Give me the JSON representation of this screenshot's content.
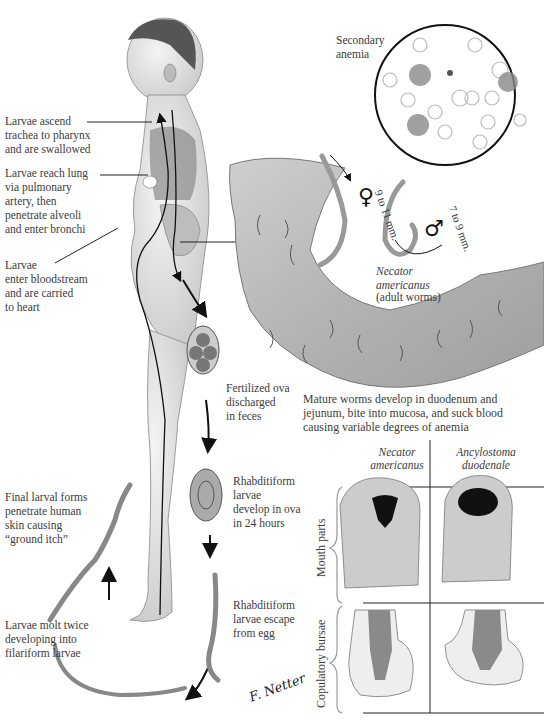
{
  "diagram": {
    "labels": {
      "larvae_ascend": "Larvae ascend\ntrachea to pharynx\nand are swallowed",
      "larvae_reach_lung": "Larvae reach lung\nvia pulmonary\nartery, then\npenetrate alveoli\nand enter bronchi",
      "larvae_enter_bloodstream": "Larvae\nenter bloodstream\nand are carried\nto heart",
      "secondary_anemia": "Secondary\nanemia",
      "female_size": "9 to 11 mm.",
      "male_size": "7 to 9 mm.",
      "female_symbol": "♀",
      "male_symbol": "♂",
      "species_adult": "Necator\namericanus",
      "adult_worms": "(adult worms)",
      "mature_worms": "Mature worms develop in duodenum and\njejunum, bite into mucosa, and suck blood\ncausing variable degrees of anemia",
      "fertilized_ova": "Fertilized ova\ndischarged\nin feces",
      "rhabditiform_develop": "Rhabditiform\nlarvae\ndevelop in ova\nin 24 hours",
      "rhabditiform_escape": "Rhabditiform\nlarvae escape\nfrom egg",
      "larvae_molt": "Larvae molt twice\ndeveloping into\nfilariform larvae",
      "final_larval": "Final larval forms\npenetrate human\nskin causing\n“ground itch”",
      "signature": "F. Netter"
    },
    "comparison_table": {
      "columns": [
        "Necator\namericanus",
        "Ancylostoma\nduodenale"
      ],
      "rows": [
        "Mouth parts",
        "Copulatory bursae"
      ]
    }
  }
}
